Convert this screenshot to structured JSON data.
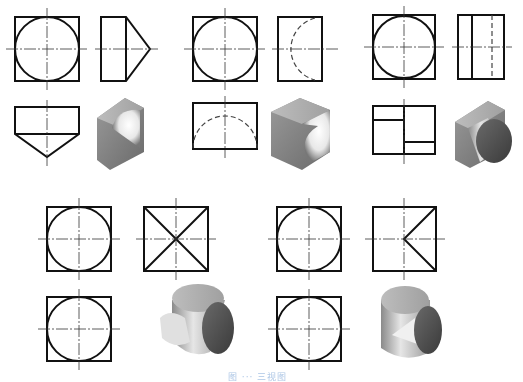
{
  "figure": {
    "caption": "图 ··· 三视图",
    "groups": [
      {
        "id": "g1",
        "description": "square block with V-shaped (prismatic) cut, front/side/top views + isometric",
        "views": [
          "front-circle-in-square",
          "side-pentagon",
          "top-pentagon",
          "isometric-block"
        ]
      },
      {
        "id": "g2",
        "description": "square block with hemispherical cavity",
        "views": [
          "front-circle-in-square",
          "side-hidden-arc",
          "top-hidden-arc",
          "isometric-block-sphere"
        ]
      },
      {
        "id": "g3",
        "description": "square plate with cylinder",
        "views": [
          "front-circle-in-square",
          "side-rect-lines",
          "top-rect-steps",
          "isometric-plate-cylinder"
        ]
      },
      {
        "id": "g4",
        "description": "two intersecting cylinders",
        "views": [
          "front-circle-in-square",
          "side-x-cross",
          "top-circle-in-square",
          "isometric-cross-cylinders"
        ]
      },
      {
        "id": "g5",
        "description": "cylinder with half-cylinder intersection",
        "views": [
          "front-circle-in-square",
          "side-k-shape",
          "top-circle-in-square",
          "isometric-cylinder-t"
        ]
      }
    ]
  },
  "colors": {
    "line": "#111111",
    "caption": "#aec7e6",
    "shade_dark": "#555555",
    "shade_light": "#eeeeee"
  }
}
